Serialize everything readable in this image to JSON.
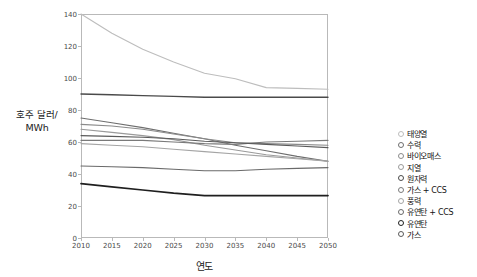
{
  "chart_data": {
    "type": "line",
    "title": "",
    "xlabel": "연도",
    "ylabel": "호주 달러/ MWh",
    "ylabel_lines": [
      "호주 달러/",
      "MWh"
    ],
    "x": [
      2010,
      2015,
      2020,
      2025,
      2030,
      2035,
      2040,
      2045,
      2050
    ],
    "xticklabels": [
      "2010",
      "2015",
      "2020",
      "2025",
      "2030",
      "2035",
      "2040",
      "2045",
      "2050"
    ],
    "yticklabels": [
      "0",
      "20",
      "40",
      "60",
      "80",
      "100",
      "120",
      "140"
    ],
    "ylim": [
      0,
      140
    ],
    "xlim": [
      2010,
      2050
    ],
    "ytick_step": 20,
    "grid": false,
    "legend_position": "right",
    "series": [
      {
        "name": "태양열",
        "color": "#bdbdbd",
        "width": 1.1,
        "marker": "open-circle",
        "values": [
          140,
          128,
          118,
          110,
          103,
          99.5,
          94,
          93.5,
          93
        ]
      },
      {
        "name": "수력",
        "color": "#6e6e6e",
        "width": 1.1,
        "marker": "filled-circle",
        "values": [
          75,
          72,
          69,
          65.5,
          62,
          58,
          54.5,
          51,
          48
        ]
      },
      {
        "name": "바이오매스",
        "color": "#8a8a8a",
        "width": 1.1,
        "marker": "filled-circle",
        "values": [
          71,
          70,
          68,
          65,
          62,
          59.5,
          59,
          58.5,
          58
        ]
      },
      {
        "name": "지열",
        "color": "#9a9a9a",
        "width": 1.1,
        "marker": "filled-circle",
        "values": [
          68,
          66,
          64,
          61.5,
          58,
          55,
          52,
          50,
          48
        ]
      },
      {
        "name": "원자력",
        "color": "#4a4a4a",
        "width": 1.4,
        "marker": "filled-circle",
        "values": [
          90,
          89.5,
          89,
          88.5,
          88,
          88,
          88,
          88,
          88
        ]
      },
      {
        "name": "가스 + CCS",
        "color": "#7a7a7a",
        "width": 1.1,
        "marker": "open-circle",
        "values": [
          61,
          61,
          61,
          60,
          59,
          58.5,
          60,
          60.5,
          61
        ]
      },
      {
        "name": "풍력",
        "color": "#a5a5a5",
        "width": 1.1,
        "marker": "open-circle",
        "values": [
          59,
          58,
          57,
          55.5,
          54,
          52.5,
          51,
          49.5,
          48
        ]
      },
      {
        "name": "유연탄 + CCS",
        "color": "#6a6a6a",
        "width": 1.1,
        "marker": "filled-circle",
        "values": [
          45,
          44.5,
          44,
          43,
          42,
          42,
          43,
          43.5,
          44
        ]
      },
      {
        "name": "유연탄",
        "color": "#1f1f1f",
        "width": 1.7,
        "marker": "filled-circle",
        "values": [
          34,
          32,
          30,
          28,
          26.5,
          26.5,
          26.5,
          26.5,
          26.5
        ]
      },
      {
        "name": "가스",
        "color": "#5a5a5a",
        "width": 1.1,
        "marker": "filled-circle",
        "values": [
          64,
          63.5,
          63,
          62,
          60.5,
          59.5,
          58.5,
          57.5,
          56.5
        ]
      }
    ]
  }
}
